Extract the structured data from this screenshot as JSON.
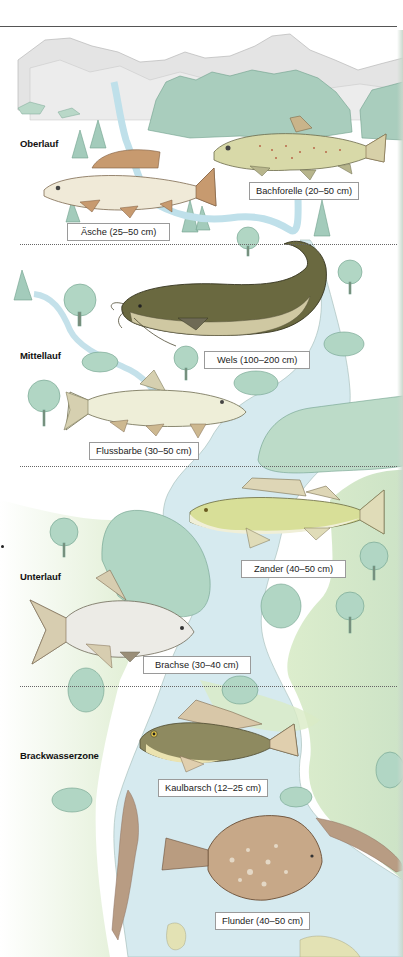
{
  "zones": [
    {
      "id": "oberlauf",
      "label": "Oberlauf"
    },
    {
      "id": "mittellauf",
      "label": "Mittellauf"
    },
    {
      "id": "unterlauf",
      "label": "Unterlauf"
    },
    {
      "id": "brackwasserzone",
      "label": "Brackwasserzone"
    }
  ],
  "fish": [
    {
      "name": "Äsche",
      "size": "25–50 cm",
      "caption": "Äsche (25–50 cm)",
      "zone": "Oberlauf"
    },
    {
      "name": "Bachforelle",
      "size": "20–50 cm",
      "caption": "Bachforelle (20–50 cm)",
      "zone": "Oberlauf"
    },
    {
      "name": "Wels",
      "size": "100–200 cm",
      "caption": "Wels (100–200 cm)",
      "zone": "Mittellauf"
    },
    {
      "name": "Flussbarbe",
      "size": "30–50 cm",
      "caption": "Flussbarbe (30–50 cm)",
      "zone": "Mittellauf"
    },
    {
      "name": "Zander",
      "size": "40–50 cm",
      "caption": "Zander (40–50 cm)",
      "zone": "Unterlauf"
    },
    {
      "name": "Brachse",
      "size": "30–40 cm",
      "caption": "Brachse (30–40 cm)",
      "zone": "Unterlauf"
    },
    {
      "name": "Kaulbarsch",
      "size": "12–25 cm",
      "caption": "Kaulbarsch (12–25 cm)",
      "zone": "Brackwasserzone"
    },
    {
      "name": "Flunder",
      "size": "40–50 cm",
      "caption": "Flunder (40–50 cm)",
      "zone": "Brackwasserzone"
    }
  ],
  "colors": {
    "river": "#cfe6ee",
    "land_green": "#d6e9c8",
    "tree": "#9cc9b6",
    "mountain": "#e2e2e2",
    "forest": "#8fbfa8",
    "shore_brown": "#b69880",
    "divider": "#666666"
  }
}
